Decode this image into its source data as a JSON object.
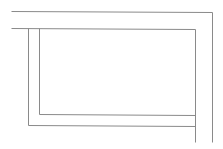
{
  "canvas": {
    "width": 223,
    "height": 149,
    "background": "#ffffff"
  },
  "style": {
    "stroke": "#8a8a8a",
    "stroke_width": 1
  },
  "lines": {
    "outer_top": {
      "x1": 11,
      "y1": 11,
      "x2": 212,
      "y2": 12
    },
    "outer_right": {
      "x1": 212,
      "y1": 12,
      "x2": 212,
      "y2": 142
    },
    "inner_top": {
      "x1": 11,
      "y1": 28,
      "x2": 195,
      "y2": 29
    },
    "frame_left": {
      "x1": 28,
      "y1": 28,
      "x2": 28,
      "y2": 125
    },
    "frame_bottom": {
      "x1": 28,
      "y1": 125,
      "x2": 195,
      "y2": 126
    },
    "inner_left": {
      "x1": 39,
      "y1": 28,
      "x2": 39,
      "y2": 114
    },
    "inner_bottom": {
      "x1": 39,
      "y1": 114,
      "x2": 195,
      "y2": 115
    },
    "inner_right": {
      "x1": 195,
      "y1": 29,
      "x2": 195,
      "y2": 142
    }
  }
}
